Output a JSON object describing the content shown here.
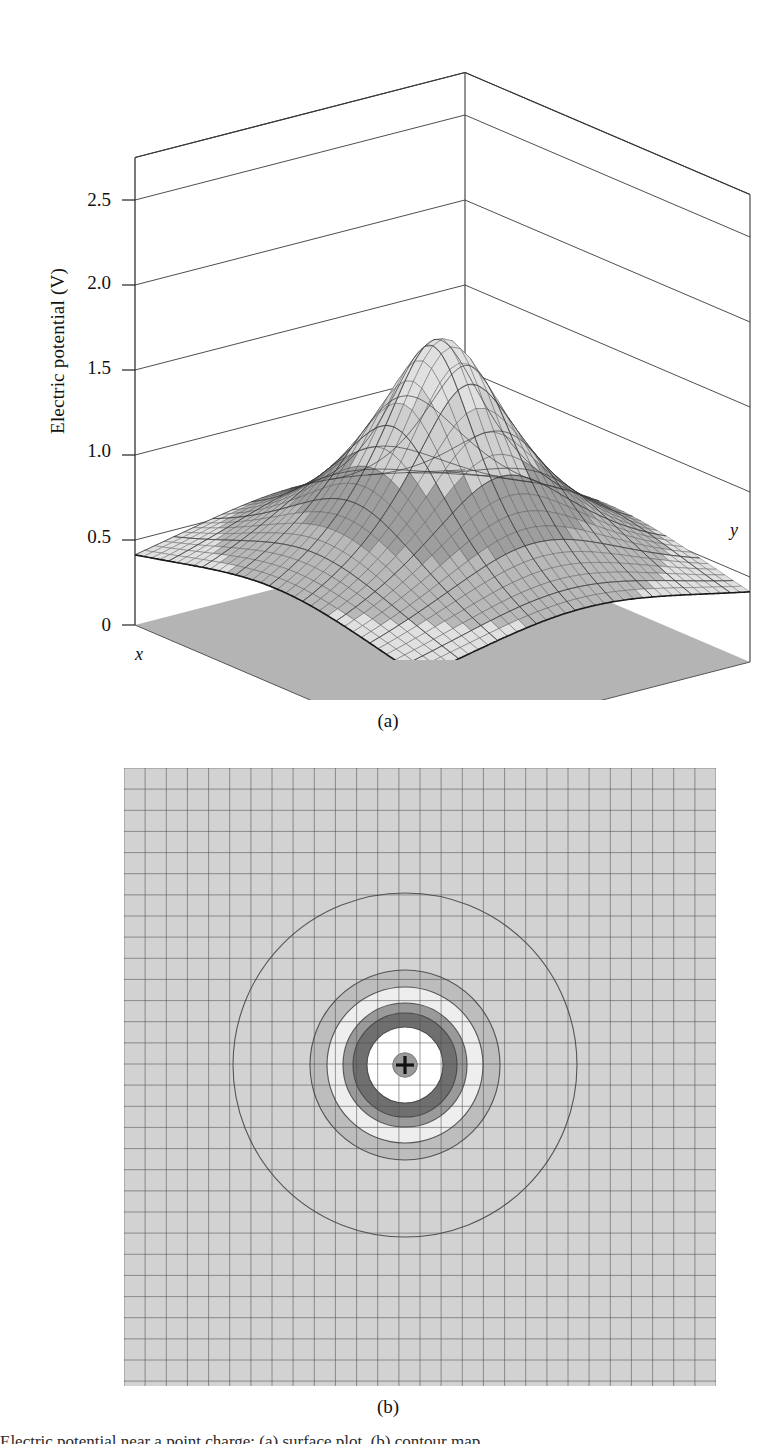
{
  "figure": {
    "panel_a_caption": "(a)",
    "panel_b_caption": "(b)",
    "bottom_caption_fragment": "Electric potential near a point charge: (a) surface plot, (b) contour map"
  },
  "panel_a": {
    "axis_title": "Electric potential (V)",
    "x_axis_letter": "x",
    "y_axis_letter": "y",
    "tick_labels": [
      "2.5",
      "2.0",
      "1.5",
      "1.0",
      "0.5",
      "0"
    ]
  },
  "panel_b": {
    "charge_symbol": "+"
  },
  "colors": {
    "background": "#ffffff",
    "ink": "#111111",
    "frame_line": "#3a3a3a",
    "mesh_line": "#4a4a4a",
    "band_0": "#ffffff",
    "band_1": "#f2f2f2",
    "band_2": "#e0e0e0",
    "band_3": "#cfcfcf",
    "band_4": "#b8b8b8",
    "band_5": "#9e9e9e",
    "band_6": "#8a8a8a",
    "band_7": "#6e6e6e",
    "band_8": "#555555",
    "floor_shadow": "#b0b0b0",
    "contour_background": "#d2d2d2",
    "charge_dot": "#9a9a9a"
  },
  "chart_data": [
    {
      "type": "surface",
      "title": "Electric potential (V) of a point charge",
      "xlabel": "x",
      "ylabel": "y",
      "zlabel": "Electric potential (V)",
      "zlim": [
        0,
        2.75
      ],
      "z_ticks": [
        0,
        0.5,
        1.0,
        1.5,
        2.0,
        2.5
      ],
      "function": "V(x,y) = k/sqrt(x^2 + y^2 + a^2), clipped at V_max",
      "peak_value": 2.75,
      "grid": true,
      "grid_on_back_walls": true,
      "mesh_resolution": [
        34,
        34
      ],
      "shading": "banded grayscale by height",
      "band_edges": [
        0.0,
        0.35,
        0.55,
        0.8,
        1.1,
        1.5,
        2.0,
        2.5
      ],
      "notes": "Singular 1/r spike at origin, truncated flat top; surface falls smoothly toward flat plane at edges"
    },
    {
      "type": "contour",
      "title": "Equipotential contour map of a point charge",
      "xlabel": "x",
      "ylabel": "y",
      "grid": true,
      "grid_spacing_cells": 28,
      "center": [
        0,
        0
      ],
      "charge_marker": "+",
      "levels": [
        0.35,
        0.5,
        0.7,
        0.95,
        1.3,
        1.9,
        2.5
      ],
      "contour_radii_px": [
        172,
        95,
        78,
        62,
        52,
        38,
        12
      ],
      "fill_shades": [
        "#d2d2d2",
        "#bdbdbd",
        "#eeeeee",
        "#9a9a9a",
        "#6f6f6f",
        "#ffffff",
        "#9a9a9a"
      ],
      "notes": "Concentric circular equipotentials; spacing decreases toward the charge"
    }
  ]
}
